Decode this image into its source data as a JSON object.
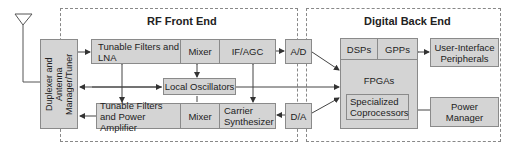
{
  "sections": {
    "rf": {
      "title": "RF Front End"
    },
    "digital": {
      "title": "Digital Back End"
    }
  },
  "blocks": {
    "duplexer": "Duplexer and Antenna Manager/Tuner",
    "filters_lna": "Tunable Filters and LNA",
    "mixer_rx": "Mixer",
    "if_agc": "IF/AGC",
    "ad": "A/D",
    "local_osc": "Local Oscillators",
    "filters_pa": "Tunable Filters and Power Amplifier",
    "mixer_tx": "Mixer",
    "carrier": "Carrier Synthesizer",
    "da": "D/A",
    "dsps": "DSPs",
    "gpps": "GPPs",
    "fpgas": "FPGAs",
    "coproc": "Specialized Coprocessors",
    "ui": "User-Interface Peripherals",
    "power": "Power Manager"
  },
  "icons": {
    "antenna": "antenna-icon"
  },
  "colors": {
    "block_fill": "#d4d4d4",
    "border": "#8a8a8a",
    "line": "#444444"
  }
}
